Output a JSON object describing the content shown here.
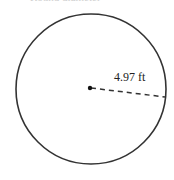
{
  "diagram": {
    "type": "circle",
    "radius_label": "4.97 ft",
    "top_text_cutoff": "Round diameter",
    "colors": {
      "stroke": "#333333",
      "background": "#ffffff"
    }
  }
}
